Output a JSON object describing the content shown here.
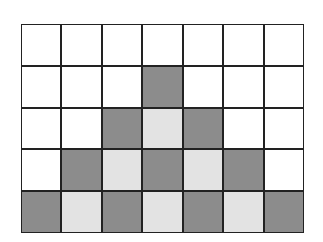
{
  "diagram": {
    "type": "grid-pattern",
    "columns": 7,
    "rows": 5,
    "colors": {
      "white": "#ffffff",
      "dark": "#8c8c8c",
      "light": "#e3e3e3",
      "line": "#222222"
    },
    "cells": [
      [
        "white",
        "white",
        "white",
        "white",
        "white",
        "white",
        "white"
      ],
      [
        "white",
        "white",
        "white",
        "dark",
        "white",
        "white",
        "white"
      ],
      [
        "white",
        "white",
        "dark",
        "light",
        "dark",
        "white",
        "white"
      ],
      [
        "white",
        "dark",
        "light",
        "dark",
        "light",
        "dark",
        "white"
      ],
      [
        "dark",
        "light",
        "dark",
        "light",
        "dark",
        "light",
        "dark"
      ]
    ]
  }
}
